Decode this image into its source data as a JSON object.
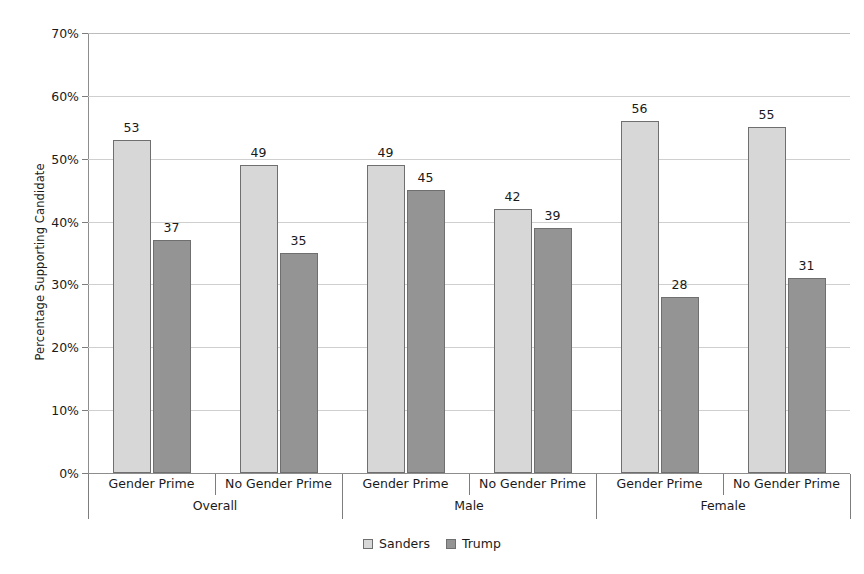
{
  "chart_data": {
    "type": "bar",
    "title": "",
    "xlabel": "",
    "ylabel": "Percentage Supporting Candidate",
    "ylim": [
      0,
      70
    ],
    "ytick_step": 10,
    "ytick_labels": [
      "0%",
      "10%",
      "20%",
      "30%",
      "40%",
      "50%",
      "60%",
      "70%"
    ],
    "ytick_values": [
      0,
      10,
      20,
      30,
      40,
      50,
      60,
      70
    ],
    "grid": "horizontal",
    "legend_position": "bottom-center",
    "categories": [
      "Gender Prime",
      "No Gender Prime",
      "Gender Prime",
      "No Gender Prime",
      "Gender Prime",
      "No Gender Prime"
    ],
    "groups": [
      {
        "label": "Overall",
        "categories": [
          "Gender Prime",
          "No Gender Prime"
        ]
      },
      {
        "label": "Male",
        "categories": [
          "Gender Prime",
          "No Gender Prime"
        ]
      },
      {
        "label": "Female",
        "categories": [
          "Gender Prime",
          "No Gender Prime"
        ]
      }
    ],
    "series": [
      {
        "name": "Sanders",
        "color": "#d7d7d7",
        "values": [
          53,
          49,
          49,
          42,
          56,
          55
        ]
      },
      {
        "name": "Trump",
        "color": "#949494",
        "values": [
          37,
          35,
          45,
          39,
          28,
          31
        ]
      }
    ],
    "data_labels": {
      "Overall": {
        "Gender Prime": {
          "Sanders": 53,
          "Trump": 37
        },
        "No Gender Prime": {
          "Sanders": 49,
          "Trump": 35
        }
      },
      "Male": {
        "Gender Prime": {
          "Sanders": 49,
          "Trump": 45
        },
        "No Gender Prime": {
          "Sanders": 42,
          "Trump": 39
        }
      },
      "Female": {
        "Gender Prime": {
          "Sanders": 56,
          "Trump": 28
        },
        "No Gender Prime": {
          "Sanders": 55,
          "Trump": 31
        }
      }
    }
  },
  "legend": {
    "items": [
      {
        "label": "Sanders",
        "swatch": "sanders"
      },
      {
        "label": "Trump",
        "swatch": "trump"
      }
    ]
  },
  "colors": {
    "sanders": "#d7d7d7",
    "trump": "#949494",
    "gridline": "#cfcfcf",
    "axis": "#7d7d7d",
    "bar_border": "#6f6f6f",
    "text": "#1a1a1a",
    "background": "#ffffff"
  }
}
